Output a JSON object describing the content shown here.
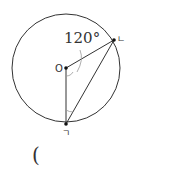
{
  "diagram": {
    "angle_label": "120°",
    "center_label": "O",
    "point_b_label": "ㄴ",
    "point_a_label": "ㄱ",
    "answer_paren": "("
  }
}
